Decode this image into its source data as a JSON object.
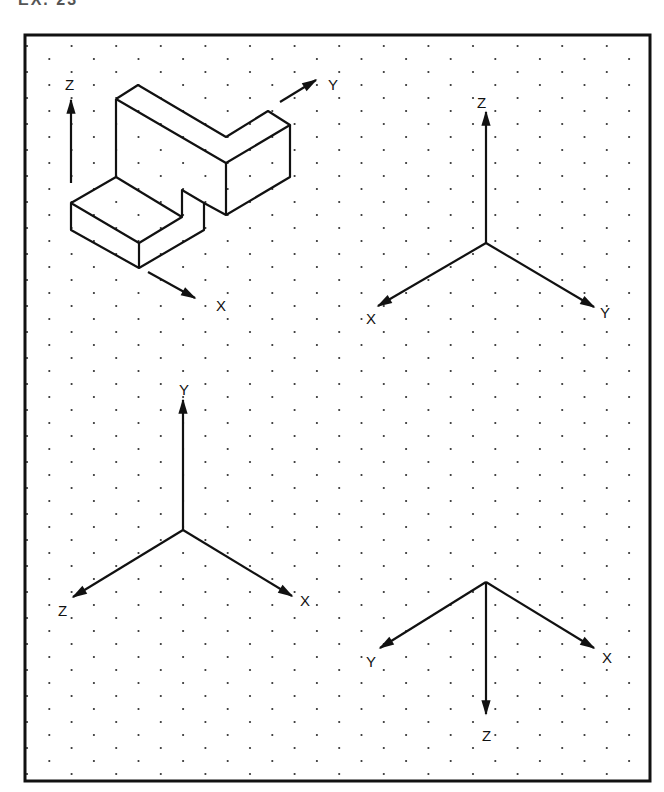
{
  "header": {
    "title": "EX. 23"
  },
  "colors": {
    "ink": "#111111",
    "dot": "#333333",
    "paper": "#ffffff"
  },
  "frame": {
    "x": 25,
    "y": 35,
    "width": 625,
    "height": 746
  },
  "dot_grid": {
    "dx": 44.6,
    "dy": 13,
    "offset_x": 22.3,
    "start_x": 27,
    "start_y": 46
  },
  "object": {
    "name": "isometric stepped block",
    "axes": {
      "z_label": "Z",
      "y_label": "Y",
      "x_label": "X"
    }
  },
  "axis_sets": [
    {
      "id": "top-right",
      "origin": [
        486,
        243
      ],
      "labels": {
        "up": "Z",
        "left": "X",
        "right": "Y"
      }
    },
    {
      "id": "bottom-left",
      "origin": [
        183,
        530
      ],
      "labels": {
        "up": "Y",
        "left": "Z",
        "right": "X"
      }
    },
    {
      "id": "bottom-right",
      "origin": [
        486,
        582
      ],
      "labels": {
        "down": "Z",
        "left": "Y",
        "right": "X"
      }
    }
  ]
}
